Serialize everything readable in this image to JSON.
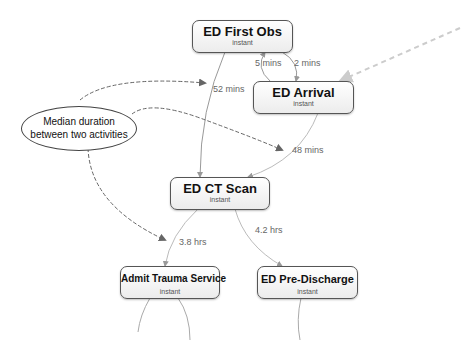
{
  "nodes": {
    "first_obs": {
      "title": "ED First Obs",
      "sub": "instant"
    },
    "arrival": {
      "title": "ED Arrival",
      "sub": "instant"
    },
    "ct_scan": {
      "title": "ED CT Scan",
      "sub": "instant"
    },
    "admit_trauma": {
      "title": "Admit Trauma Service",
      "sub": "instant"
    },
    "pre_discharge": {
      "title": "ED Pre-Discharge",
      "sub": "instant"
    }
  },
  "edges": {
    "arrival_to_first_obs": "5 mins",
    "first_obs_to_arrival": "2 mins",
    "first_obs_to_ct": "52 mins",
    "arrival_to_ct": "48 mins",
    "ct_to_admit": "3.8 hrs",
    "ct_to_pre_discharge": "4.2 hrs"
  },
  "annotation": {
    "line1": "Median duration",
    "line2": "between two activities"
  },
  "colors": {
    "edge": "#9a9a9a",
    "annotation_arrow": "#666666",
    "start_arrow": "#cccccc",
    "node_border": "#555555"
  }
}
